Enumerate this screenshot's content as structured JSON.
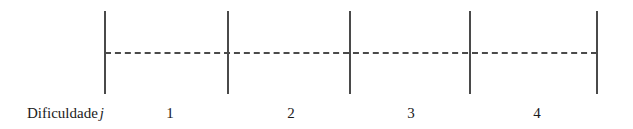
{
  "figure": {
    "width": 633,
    "height": 129,
    "background_color": "#ffffff",
    "line_color": "#4a4a4a",
    "text_color": "#1b1b1b"
  },
  "axis": {
    "label_prefix": "Dificuldade",
    "label_variable": "j",
    "label_x": 27,
    "label_baseline_y": 118,
    "dashed_line": {
      "y": 52,
      "x_start": 105,
      "x_end": 597,
      "dash_length": 6,
      "gap_length": 3,
      "color": "#4a4a4a"
    },
    "ticks": [
      {
        "name": "tick-0",
        "x": 105,
        "y_top": 11,
        "y_bottom": 94
      },
      {
        "name": "tick-1",
        "x": 228,
        "y_top": 11,
        "y_bottom": 94
      },
      {
        "name": "tick-2",
        "x": 350,
        "y_top": 11,
        "y_bottom": 94
      },
      {
        "name": "tick-3",
        "x": 470,
        "y_top": 11,
        "y_bottom": 94
      },
      {
        "name": "tick-4",
        "x": 597,
        "y_top": 11,
        "y_bottom": 94
      }
    ],
    "intervals": [
      {
        "label": "1",
        "center_x": 170,
        "baseline_y": 118
      },
      {
        "label": "2",
        "center_x": 291,
        "baseline_y": 118
      },
      {
        "label": "3",
        "center_x": 411,
        "baseline_y": 118
      },
      {
        "label": "4",
        "center_x": 537,
        "baseline_y": 118
      }
    ]
  }
}
